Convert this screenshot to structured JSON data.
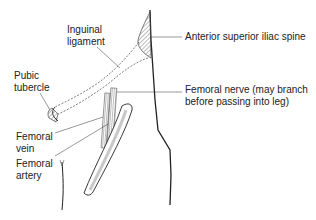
{
  "diagram": {
    "type": "anatomical-illustration",
    "labels": {
      "inguinal_ligament": "Inguinal\nligament",
      "asis": "Anterior superior iliac spine",
      "pubic_tubercle": "Pubic\ntubercle",
      "femoral_nerve": "Femoral nerve (may branch\nbefore passing into leg)",
      "femoral_vein": "Femoral\nvein",
      "femoral_artery": "Femoral\nartery"
    },
    "colors": {
      "line": "#222222",
      "hatch": "#555555",
      "shade": "#cccccc",
      "background": "#ffffff"
    }
  }
}
